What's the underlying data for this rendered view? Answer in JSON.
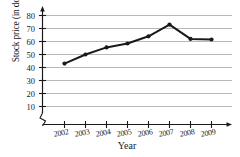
{
  "chart_data": {
    "type": "line",
    "title": "",
    "xlabel": "Year",
    "ylabel": "Stock price (in dollars)",
    "categories": [
      "2002",
      "2003",
      "2004",
      "2005",
      "2006",
      "2007",
      "2008",
      "2009"
    ],
    "values": [
      43,
      50,
      55.5,
      58.5,
      64,
      73,
      62,
      61.5
    ],
    "yticks": [
      10,
      20,
      30,
      40,
      50,
      60,
      70,
      80
    ],
    "ylim": [
      0,
      85
    ],
    "grid": "horizontal",
    "legend": "none",
    "axis_break": "y-axis zigzag near origin",
    "marker": "filled-circle",
    "line_color": "#1a1a1a",
    "grid_color": "#b4b4b4"
  },
  "labels": {
    "y0": "10",
    "y1": "20",
    "y2": "30",
    "y3": "40",
    "y4": "50",
    "y5": "60",
    "y6": "70",
    "y7": "80",
    "x0": "2002",
    "x1": "2003",
    "x2": "2004",
    "x3": "2005",
    "x4": "2006",
    "x5": "2007",
    "x6": "2008",
    "x7": "2009"
  }
}
